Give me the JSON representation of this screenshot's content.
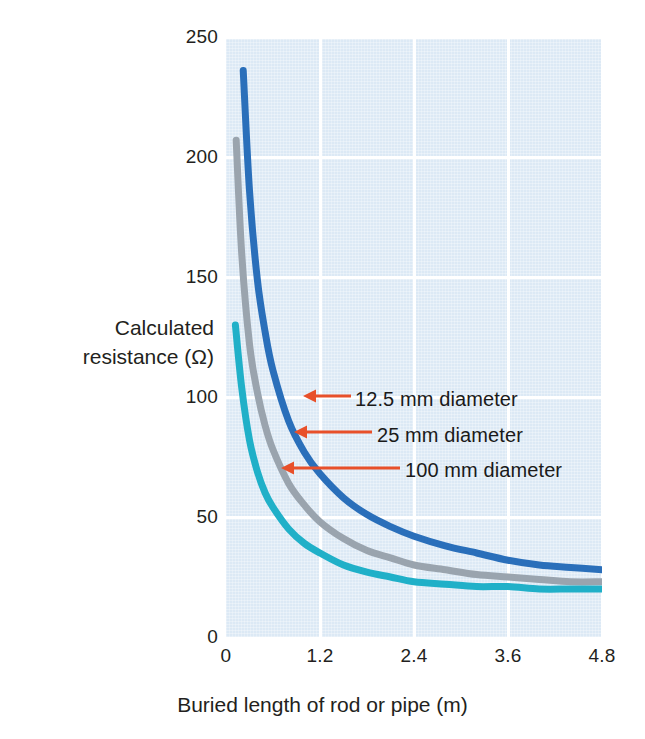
{
  "chart_data": {
    "type": "line",
    "title": "",
    "xlabel": "Buried length of rod or pipe (m)",
    "ylabel": "Calculated resistance (Ω)",
    "ylabel_line1": "Calculated",
    "ylabel_line2": "resistance (Ω)",
    "xlim": [
      0,
      4.8
    ],
    "ylim": [
      0,
      250
    ],
    "grid": true,
    "legend_position": "inline-annotations",
    "xticks": [
      "0",
      "1.2",
      "2.4",
      "3.6",
      "4.8"
    ],
    "xtick_values": [
      0,
      1.2,
      2.4,
      3.6,
      4.8
    ],
    "yticks": [
      "0",
      "50",
      "100",
      "150",
      "200",
      "250"
    ],
    "ytick_values": [
      0,
      50,
      100,
      150,
      200,
      250
    ],
    "series": [
      {
        "name": "12.5 mm diameter",
        "color": "#2a6fba",
        "x": [
          0.22,
          0.3,
          0.4,
          0.5,
          0.6,
          0.8,
          1.0,
          1.2,
          1.5,
          1.8,
          2.1,
          2.4,
          2.8,
          3.2,
          3.6,
          4.0,
          4.4,
          4.8
        ],
        "values": [
          236,
          186,
          149,
          127,
          111,
          90,
          77,
          68,
          58,
          51,
          46,
          42,
          38,
          35,
          32,
          30,
          29,
          28
        ]
      },
      {
        "name": "25 mm diameter",
        "color": "#9aa4ae",
        "x": [
          0.13,
          0.2,
          0.3,
          0.4,
          0.5,
          0.6,
          0.8,
          1.0,
          1.2,
          1.5,
          1.8,
          2.1,
          2.4,
          2.8,
          3.2,
          3.6,
          4.0,
          4.4,
          4.8
        ],
        "values": [
          207,
          160,
          122,
          102,
          88,
          78,
          64,
          55,
          48,
          41,
          36,
          33,
          30,
          28,
          26,
          25,
          24,
          23,
          23
        ]
      },
      {
        "name": "100 mm diameter",
        "color": "#20b0c8",
        "x": [
          0.12,
          0.2,
          0.3,
          0.4,
          0.5,
          0.6,
          0.8,
          1.0,
          1.2,
          1.5,
          1.8,
          2.1,
          2.4,
          2.8,
          3.2,
          3.6,
          4.0,
          4.4,
          4.8
        ],
        "values": [
          130,
          104,
          82,
          69,
          60,
          54,
          45,
          39,
          35,
          30,
          27,
          25,
          23,
          22,
          21,
          21,
          20,
          20,
          20
        ]
      }
    ],
    "annotations": [
      {
        "label": "12.5 mm diameter",
        "arrow_color": "#e8502a",
        "target_series": "12.5 mm diameter",
        "text_x": 355,
        "text_y": 389,
        "arrow_tail_x": 351,
        "arrow_tail_y": 396,
        "arrow_head_x": 303,
        "arrow_head_y": 396
      },
      {
        "label": "25 mm diameter",
        "arrow_color": "#e8502a",
        "target_series": "25 mm diameter",
        "text_x": 377,
        "text_y": 425,
        "arrow_tail_x": 372,
        "arrow_tail_y": 432,
        "arrow_head_x": 294,
        "arrow_head_y": 432
      },
      {
        "label": "100 mm diameter",
        "arrow_color": "#e8502a",
        "target_series": "100 mm diameter",
        "text_x": 405,
        "text_y": 460,
        "arrow_tail_x": 400,
        "arrow_tail_y": 468,
        "arrow_head_x": 281,
        "arrow_head_y": 468
      }
    ],
    "colors": {
      "panel_background": "#dce9f5",
      "gridline": "#ffffff",
      "text": "#231f20",
      "arrow": "#e8502a"
    }
  }
}
